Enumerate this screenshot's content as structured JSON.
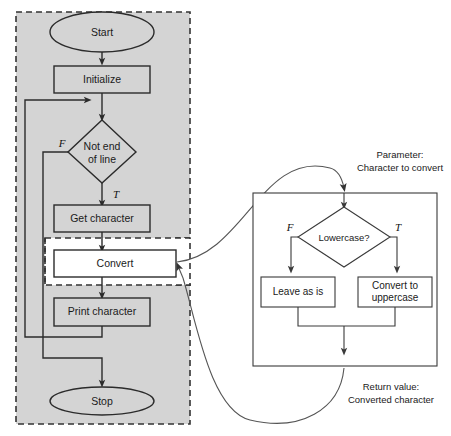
{
  "diagram": {
    "main_flow": {
      "region_label": "main-program-dashed-region",
      "nodes": [
        {
          "id": "start",
          "shape": "terminator",
          "label": "Start"
        },
        {
          "id": "init",
          "shape": "process",
          "label": "Initialize"
        },
        {
          "id": "notend",
          "shape": "decision",
          "label_line1": "Not end",
          "label_line2": "of line"
        },
        {
          "id": "getchar",
          "shape": "process",
          "label": "Get character"
        },
        {
          "id": "convert",
          "shape": "process",
          "label": "Convert"
        },
        {
          "id": "print",
          "shape": "process",
          "label": "Print character"
        },
        {
          "id": "stop",
          "shape": "terminator",
          "label": "Stop"
        }
      ],
      "branch_labels": {
        "false": "F",
        "true": "T"
      }
    },
    "subprogram": {
      "parameter_note_line1": "Parameter:",
      "parameter_note_line2": "Character to convert",
      "return_note_line1": "Return value:",
      "return_note_line2": "Converted character",
      "nodes": [
        {
          "id": "lowercase",
          "shape": "decision",
          "label": "Lowercase?"
        },
        {
          "id": "leave",
          "shape": "process",
          "label": "Leave as is"
        },
        {
          "id": "upper",
          "shape": "process",
          "label_line1": "Convert to",
          "label_line2": "uppercase"
        }
      ],
      "branch_labels": {
        "false": "F",
        "true": "T"
      }
    },
    "colors": {
      "region_fill": "#d4d4d4",
      "node_fill": "#d4d4d4",
      "highlight_fill": "#ffffff",
      "stroke": "#2b2b2b",
      "connector": "#555555"
    }
  }
}
